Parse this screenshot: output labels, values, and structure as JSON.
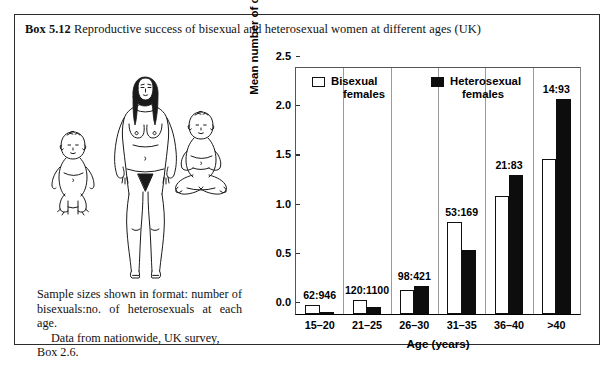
{
  "box": {
    "number": "Box 5.12",
    "title": "Reproductive success of bisexual and heterosexual women at different ages (UK)"
  },
  "caption": {
    "paragraph1": "Sample sizes shown in format: number of bisexuals:no. of heterosexuals at each age.",
    "paragraph2": "Data from nationwide, UK survey, Box 2.6."
  },
  "illustration": {
    "name": "woman-with-two-babies-line-drawing"
  },
  "chart_data": {
    "type": "bar",
    "title": "",
    "xlabel": "Age (years)",
    "ylabel": "Mean number of children",
    "categories": [
      "15–20",
      "21–25",
      "26–30",
      "31–35",
      "36–40",
      ">40"
    ],
    "ylim": [
      0,
      2.5
    ],
    "yticks": [
      "0.0",
      "0.5",
      "1.0",
      "1.5",
      "2.0",
      "2.5"
    ],
    "ytick_values": [
      0,
      0.5,
      1.0,
      1.5,
      2.0,
      2.5
    ],
    "grid": false,
    "legend_position": "top-left-inside",
    "series": [
      {
        "name": "Bisexual females",
        "color": "#ffffff",
        "values": [
          0.09,
          0.14,
          0.24,
          0.94,
          1.2,
          1.58
        ]
      },
      {
        "name": "Heterosexual females",
        "color": "#0d0d0d",
        "values": [
          0.02,
          0.07,
          0.28,
          0.65,
          1.41,
          2.19
        ]
      }
    ],
    "annotations": [
      "62:946",
      "120:1100",
      "98:421",
      "53:169",
      "21:83",
      "14:93"
    ]
  },
  "legend": {
    "items": [
      {
        "line1": "Bisexual",
        "line2": "females"
      },
      {
        "line1": "Heterosexual",
        "line2": "females"
      }
    ]
  }
}
